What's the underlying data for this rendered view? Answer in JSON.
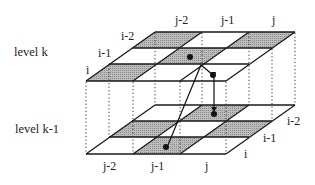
{
  "diagram": {
    "type": "two-level grid with cell correspondences",
    "levels": [
      {
        "label": "level k",
        "position": "top"
      },
      {
        "label": "level k-1",
        "position": "bottom"
      }
    ],
    "top_labels": {
      "rows": [
        "i",
        "i-1",
        "i-2"
      ],
      "cols": [
        "j-2",
        "j-1",
        "j"
      ]
    },
    "bottom_labels": {
      "rows": [
        "i",
        "i-1",
        "i-2"
      ],
      "cols": [
        "j-2",
        "j-1",
        "j"
      ]
    },
    "colors": {
      "line": "#1a1a1a",
      "shade": "#a8a8a8",
      "background": "#ffffff"
    }
  }
}
